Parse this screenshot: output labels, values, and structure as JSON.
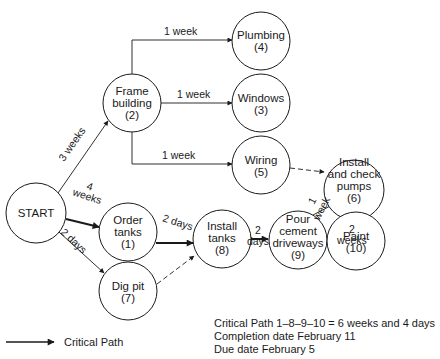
{
  "nodes": [
    {
      "id": "start",
      "lines": [
        "START"
      ],
      "cx": 36,
      "cy": 213
    },
    {
      "id": "frame-building",
      "lines": [
        "Frame",
        "building",
        "(2)"
      ],
      "cx": 132,
      "cy": 103
    },
    {
      "id": "plumbing",
      "lines": [
        "Plumbing",
        "(4)"
      ],
      "cx": 261,
      "cy": 41
    },
    {
      "id": "windows",
      "lines": [
        "Windows",
        "(3)"
      ],
      "cx": 261,
      "cy": 103
    },
    {
      "id": "wiring",
      "lines": [
        "Wiring",
        "(5)"
      ],
      "cx": 261,
      "cy": 165
    },
    {
      "id": "install-check-pumps",
      "lines": [
        "Install",
        "and check",
        "pumps",
        "(6)"
      ],
      "cx": 354,
      "cy": 190
    },
    {
      "id": "order-tanks",
      "lines": [
        "Order",
        "tanks",
        "(1)"
      ],
      "cx": 128,
      "cy": 232
    },
    {
      "id": "dig-pit",
      "lines": [
        "Dig pit",
        "(7)"
      ],
      "cx": 128,
      "cy": 291
    },
    {
      "id": "install-tanks",
      "lines": [
        "Install",
        "tanks",
        "(8)"
      ],
      "cx": 222,
      "cy": 239
    },
    {
      "id": "pour-cement",
      "lines": [
        "Pour",
        "cement",
        "driveways",
        "(9)"
      ],
      "cx": 298,
      "cy": 240
    },
    {
      "id": "paint",
      "lines": [
        "Paint",
        "(10)"
      ],
      "cx": 356,
      "cy": 241
    }
  ],
  "edges": [
    {
      "from": "start",
      "to": "frame-building",
      "label": "3 weeks",
      "style": "normal"
    },
    {
      "from": "frame-building",
      "to": "plumbing",
      "label": "1 week",
      "style": "normal"
    },
    {
      "from": "frame-building",
      "to": "windows",
      "label": "1 week",
      "style": "normal"
    },
    {
      "from": "frame-building",
      "to": "wiring",
      "label": "1 week",
      "style": "normal"
    },
    {
      "from": "wiring",
      "to": "install-check-pumps",
      "label": "",
      "style": "dashed"
    },
    {
      "from": "start",
      "to": "order-tanks",
      "label": "4 weeks",
      "style": "critical"
    },
    {
      "from": "start",
      "to": "dig-pit",
      "label": "2 days",
      "style": "normal"
    },
    {
      "from": "order-tanks",
      "to": "install-tanks",
      "label": "2 days",
      "style": "critical"
    },
    {
      "from": "dig-pit",
      "to": "install-tanks",
      "label": "",
      "style": "dashed"
    },
    {
      "from": "install-tanks",
      "to": "pour-cement",
      "label": "2 days",
      "style": "critical"
    },
    {
      "from": "pour-cement",
      "to": "install-check-pumps",
      "label": "1 week",
      "style": "normal"
    },
    {
      "from": "pour-cement",
      "to": "paint",
      "label": "2 weeks",
      "style": "critical"
    }
  ],
  "labels": {
    "e_start_frame": "3 weeks",
    "e_frame_plumbing": "1 week",
    "e_frame_windows": "1 week",
    "e_frame_wiring": "1 week",
    "e_start_order_1": "4",
    "e_start_order_2": "weeks",
    "e_start_dig": "2 days",
    "e_order_install": "2 days",
    "e_install_pour_1": "2",
    "e_install_pour_2": "days",
    "e_pour_pumps_1": "1",
    "e_pour_pumps_2": "week",
    "e_pour_paint_1": "2",
    "e_pour_paint_2": "weeks"
  },
  "node_text": {
    "start": [
      "START"
    ],
    "frame": [
      "Frame",
      "building",
      "(2)"
    ],
    "plumbing": [
      "Plumbing",
      "(4)"
    ],
    "windows": [
      "Windows",
      "(3)"
    ],
    "wiring": [
      "Wiring",
      "(5)"
    ],
    "pumps": [
      "Install",
      "and check",
      "pumps",
      "(6)"
    ],
    "order": [
      "Order",
      "tanks",
      "(1)"
    ],
    "dig": [
      "Dig pit",
      "(7)"
    ],
    "install": [
      "Install",
      "tanks",
      "(8)"
    ],
    "pour": [
      "Pour",
      "cement",
      "driveways",
      "(9)"
    ],
    "paint": [
      "Paint",
      "(10)"
    ]
  },
  "legend": {
    "critical_path_label": "Critical Path"
  },
  "notes": {
    "critical_path": "Critical Path 1–8–9–10 = 6 weeks and 4 days",
    "completion_date": "Completion date February 11",
    "due_date": "Due date February 5"
  },
  "colors": {
    "stroke": "#1a1a1a",
    "background": "#ffffff"
  }
}
